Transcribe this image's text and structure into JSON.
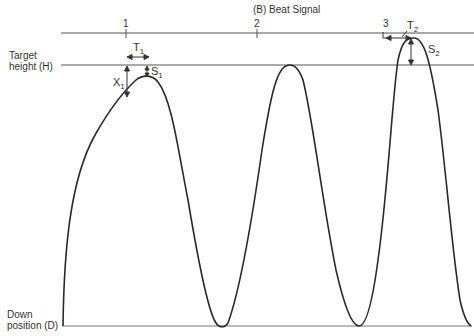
{
  "title": "(B) Beat Signal",
  "beat_markers": [
    {
      "label": "1",
      "x": 126
    },
    {
      "label": "2",
      "x": 257
    },
    {
      "label": "3",
      "x": 383
    }
  ],
  "axis_labels": {
    "target_line1": "Target",
    "target_line2": "height (H)",
    "down_line1": "Down",
    "down_line2": "position (D)"
  },
  "annotations": {
    "T1": {
      "base": "T",
      "sub": "1"
    },
    "X1": {
      "base": "X",
      "sub": "1"
    },
    "S1": {
      "base": "S",
      "sub": "1"
    },
    "T2": {
      "base": "T",
      "sub": "2"
    },
    "S2": {
      "base": "S",
      "sub": "2"
    }
  },
  "colors": {
    "line": "#2a2a2a",
    "guide": "#555555",
    "background": "#ffffff"
  }
}
